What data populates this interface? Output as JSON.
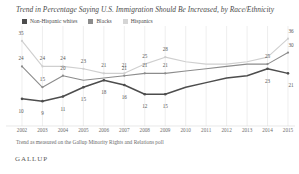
{
  "title": "Trend in Percentage Saying U.S. Immigration Should Be Increased, by Race/Ethnicity",
  "legend": {
    "items": [
      {
        "label": "Non-Hispanic whites",
        "color": "#4d4d4d"
      },
      {
        "label": "Blacks",
        "color": "#8c8c8c"
      },
      {
        "label": "Hispanics",
        "color": "#cfcfcf"
      }
    ]
  },
  "footnote": "Trend as measured on the Gallup Minority Rights and Relations poll",
  "logo": "GALLUP",
  "chart_data": {
    "type": "line",
    "title": "Trend in Percentage Saying U.S. Immigration Should Be Increased, by Race/Ethnicity",
    "xlabel": "",
    "ylabel": "",
    "ylim": [
      0,
      38
    ],
    "grid": true,
    "legend_position": "top-left",
    "categories": [
      "2002",
      "2003",
      "2004",
      "2005",
      "2006",
      "2007",
      "2008",
      "2009",
      "2010",
      "2011",
      "2012",
      "2013",
      "2014",
      "2015"
    ],
    "series": [
      {
        "name": "Non-Hispanic whites",
        "color": "#4d4d4d",
        "values": [
          10,
          9,
          11,
          15,
          18,
          16,
          12,
          12,
          15,
          17,
          19,
          20,
          23,
          21
        ],
        "labels": [
          "10",
          "9",
          "11",
          "15",
          "18",
          "16",
          "12",
          "15",
          "",
          "",
          "",
          "",
          "23",
          "21"
        ]
      },
      {
        "name": "Blacks",
        "color": "#8c8c8c",
        "values": [
          24,
          15,
          20,
          18,
          19,
          20,
          21,
          21,
          22,
          23,
          24,
          25,
          25,
          30
        ],
        "labels": [
          "24",
          "15",
          "20",
          "",
          "",
          "21",
          "21",
          "21",
          "",
          "",
          "",
          "",
          "25",
          "30"
        ]
      },
      {
        "name": "Hispanics",
        "color": "#cfcfcf",
        "values": [
          35,
          24,
          24,
          23,
          21,
          21,
          25,
          28,
          26,
          25,
          25,
          26,
          28,
          36
        ],
        "labels": [
          "35",
          "24",
          "24",
          "23",
          "21",
          "21",
          "25",
          "28",
          "",
          "",
          "",
          "",
          "",
          "36"
        ]
      }
    ],
    "y_top_label": "35"
  }
}
